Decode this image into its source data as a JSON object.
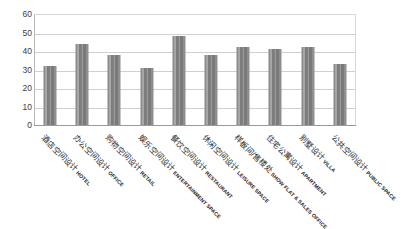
{
  "chart_data": {
    "type": "bar",
    "title": "",
    "xlabel": "",
    "ylabel": "",
    "ylim": [
      0,
      60
    ],
    "ytick_step": 10,
    "grid": true,
    "legend": "none",
    "bar_color": "#8a8a8a",
    "categories": [
      "酒店空间设计 HOTEL",
      "办公空间设计 OFFICE",
      "购物空间设计 RETAIL",
      "娱乐空间设计 ENTERTAINMENT SPACE",
      "餐饮空间设计 RESTAURANT",
      "休闲空间设计 LEISURE SPACE",
      "样板间/售楼处 SHOW FLAT & SALES OFFICE",
      "住宅公寓设计 APARTMENT",
      "别墅设计 VILLA",
      "公共空间设计 PUBLIC SPACE"
    ],
    "categories_cn": [
      "酒店空间设计",
      "办公空间设计",
      "购物空间设计",
      "娱乐空间设计",
      "餐饮空间设计",
      "休闲空间设计",
      "样板间/售楼处",
      "住宅公寓设计",
      "别墅设计",
      "公共空间设计"
    ],
    "categories_en": [
      "HOTEL",
      "OFFICE",
      "RETAIL",
      "ENTERTAINMENT SPACE",
      "RESTAURANT",
      "LEISURE SPACE",
      "SHOW FLAT & SALES OFFICE",
      "APARTMENT",
      "VILLA",
      "PUBLIC SPACE"
    ],
    "values": [
      32,
      44,
      38,
      31,
      48,
      38,
      42,
      41,
      42,
      33
    ],
    "ytick_labels": [
      "60",
      "50",
      "40",
      "30",
      "20",
      "10",
      "0"
    ],
    "ytick_values": [
      60,
      50,
      40,
      30,
      20,
      10,
      0
    ]
  }
}
